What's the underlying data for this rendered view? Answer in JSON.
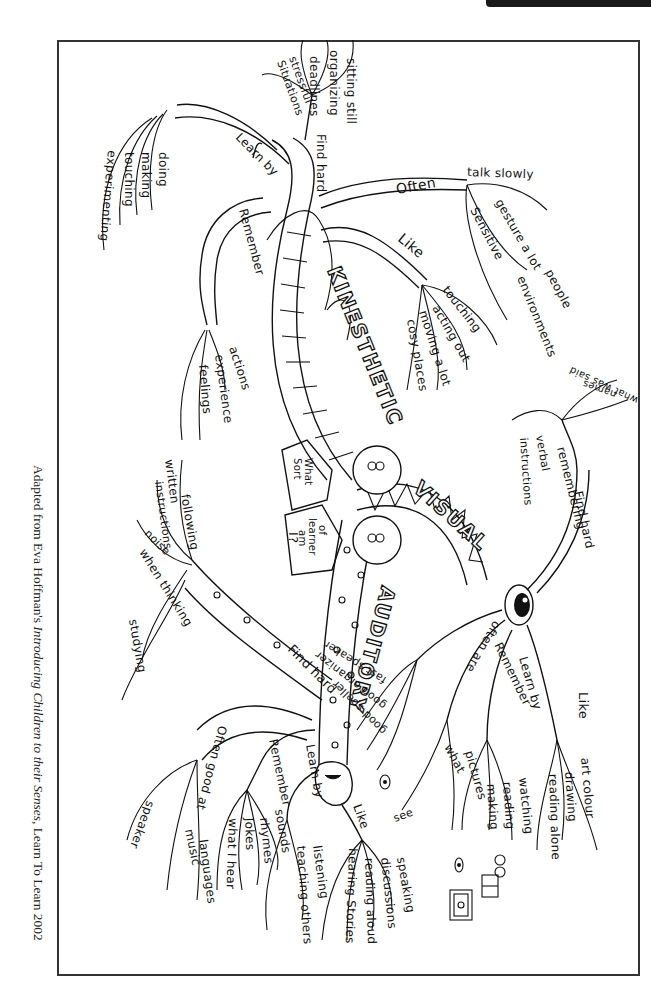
{
  "page": {
    "header_tab": "RESOURCE MATERIAL",
    "caption": {
      "prefix": "Adapted from Eva Hoffman's ",
      "title": "Introducing Children to their Senses",
      "suffix": ", Learn To Learn 2002"
    }
  },
  "mindmap": {
    "center": {
      "line1": "What",
      "line2": "Sort",
      "line3": "of",
      "line4": "learner",
      "line5": "am",
      "line6": "I?"
    },
    "kinesthetic": {
      "title": "KINESTHETIC",
      "learn_by": {
        "label": "Learn by",
        "items": [
          "doing",
          "making",
          "touching",
          "experimenting"
        ]
      },
      "find_hard": {
        "label": "Find hard",
        "items": [
          "sitting still",
          "organizing",
          "deadlines",
          "stressful situations"
        ]
      },
      "often": {
        "label": "Often",
        "items": [
          "talk slowly",
          "gesture a lot",
          "Sensitive",
          "people",
          "environments"
        ]
      },
      "like": {
        "label": "Like",
        "items": [
          "touching",
          "acting out",
          "moving a lot",
          "cosy places"
        ]
      },
      "remember": {
        "label": "Remember",
        "items": [
          "actions",
          "experience",
          "feelings"
        ]
      }
    },
    "visual": {
      "title": "VISUAL",
      "find_hard": {
        "label": "Find hard",
        "items": [
          "remembering",
          "names",
          "what was said",
          "verbal instructions"
        ]
      },
      "like": {
        "label": "Like",
        "items": [
          "art colour",
          "drawing",
          "reading alone"
        ]
      },
      "learn_by": {
        "label": "Learn by",
        "items": [
          "watching",
          "reading",
          "making"
        ]
      },
      "remember": {
        "label": "Remember",
        "items": [
          "pictures",
          "what I see"
        ]
      },
      "often_are": {
        "label": "often are",
        "items": [
          "fast speaker",
          "good organizer",
          "good speller"
        ]
      }
    },
    "auditory": {
      "title": "AUDITORY",
      "find_hard": {
        "label": "Find hard",
        "items": [
          "following written instructions",
          "noise when thinking",
          "studying"
        ]
      },
      "often_good_at": {
        "label": "Often good at",
        "items": [
          "speaker",
          "music",
          "languages"
        ]
      },
      "remember": {
        "label": "Remember",
        "items": [
          "what I hear",
          "Jokes",
          "rhymes",
          "sounds"
        ]
      },
      "learn_by": {
        "label": "Learn by",
        "items": [
          "listening",
          "teaching others"
        ]
      },
      "like": {
        "label": "Like",
        "items": [
          "speaking",
          "discussions",
          "reading aloud",
          "hearing Stories"
        ]
      }
    }
  }
}
